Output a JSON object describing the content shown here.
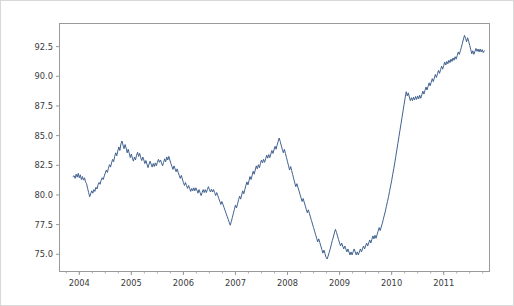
{
  "chart_data": {
    "type": "line",
    "title": "",
    "xlabel": "",
    "ylabel": "",
    "xlim": [
      2003.62,
      2011.88
    ],
    "ylim": [
      73.55,
      94.45
    ],
    "grid": false,
    "legend": null,
    "line_color": "#41618f",
    "background_color": "#ffffff",
    "axis_color": "#9a9a9a",
    "xticks": [
      2004,
      2005,
      2006,
      2007,
      2008,
      2009,
      2010,
      2011
    ],
    "xticklabels": [
      "2004",
      "2005",
      "2006",
      "2007",
      "2008",
      "2009",
      "2010",
      "2011"
    ],
    "yticks": [
      75.0,
      77.5,
      80.0,
      82.5,
      85.0,
      87.5,
      90.0,
      92.5
    ],
    "yticklabels": [
      "75.0",
      "77.5",
      "80.0",
      "82.5",
      "85.0",
      "87.5",
      "90.0",
      "92.5"
    ],
    "minor_xtick_interval": 0.25,
    "series": [
      {
        "name": "value",
        "x": [
          2003.88,
          2003.9,
          2003.92,
          2003.94,
          2003.96,
          2003.98,
          2004.0,
          2004.02,
          2004.04,
          2004.06,
          2004.08,
          2004.1,
          2004.12,
          2004.14,
          2004.16,
          2004.18,
          2004.2,
          2004.22,
          2004.24,
          2004.26,
          2004.28,
          2004.3,
          2004.32,
          2004.34,
          2004.36,
          2004.38,
          2004.4,
          2004.42,
          2004.44,
          2004.46,
          2004.48,
          2004.5,
          2004.52,
          2004.54,
          2004.56,
          2004.58,
          2004.6,
          2004.62,
          2004.64,
          2004.66,
          2004.68,
          2004.7,
          2004.72,
          2004.74,
          2004.76,
          2004.78,
          2004.8,
          2004.82,
          2004.84,
          2004.86,
          2004.88,
          2004.9,
          2004.92,
          2004.94,
          2004.96,
          2004.98,
          2005.0,
          2005.02,
          2005.04,
          2005.06,
          2005.08,
          2005.1,
          2005.12,
          2005.14,
          2005.16,
          2005.18,
          2005.2,
          2005.22,
          2005.24,
          2005.26,
          2005.28,
          2005.3,
          2005.32,
          2005.34,
          2005.36,
          2005.38,
          2005.4,
          2005.42,
          2005.44,
          2005.46,
          2005.48,
          2005.5,
          2005.52,
          2005.54,
          2005.56,
          2005.58,
          2005.6,
          2005.62,
          2005.64,
          2005.66,
          2005.68,
          2005.7,
          2005.72,
          2005.74,
          2005.76,
          2005.78,
          2005.8,
          2005.82,
          2005.84,
          2005.86,
          2005.88,
          2005.9,
          2005.92,
          2005.94,
          2005.96,
          2005.98,
          2006.0,
          2006.02,
          2006.04,
          2006.06,
          2006.08,
          2006.1,
          2006.12,
          2006.14,
          2006.16,
          2006.18,
          2006.2,
          2006.22,
          2006.24,
          2006.26,
          2006.28,
          2006.3,
          2006.32,
          2006.34,
          2006.36,
          2006.38,
          2006.4,
          2006.42,
          2006.44,
          2006.46,
          2006.48,
          2006.5,
          2006.52,
          2006.54,
          2006.56,
          2006.58,
          2006.6,
          2006.62,
          2006.64,
          2006.66,
          2006.68,
          2006.7,
          2006.72,
          2006.74,
          2006.76,
          2006.78,
          2006.8,
          2006.82,
          2006.84,
          2006.86,
          2006.88,
          2006.9,
          2006.92,
          2006.94,
          2006.96,
          2006.98,
          2007.0,
          2007.02,
          2007.04,
          2007.06,
          2007.08,
          2007.1,
          2007.12,
          2007.14,
          2007.16,
          2007.18,
          2007.2,
          2007.22,
          2007.24,
          2007.26,
          2007.28,
          2007.3,
          2007.32,
          2007.34,
          2007.36,
          2007.38,
          2007.4,
          2007.42,
          2007.44,
          2007.46,
          2007.48,
          2007.5,
          2007.52,
          2007.54,
          2007.56,
          2007.58,
          2007.6,
          2007.62,
          2007.64,
          2007.66,
          2007.68,
          2007.7,
          2007.72,
          2007.74,
          2007.76,
          2007.78,
          2007.8,
          2007.82,
          2007.84,
          2007.86,
          2007.88,
          2007.9,
          2007.92,
          2007.94,
          2007.96,
          2007.98,
          2008.0,
          2008.02,
          2008.04,
          2008.06,
          2008.08,
          2008.1,
          2008.12,
          2008.14,
          2008.16,
          2008.18,
          2008.2,
          2008.22,
          2008.24,
          2008.26,
          2008.28,
          2008.3,
          2008.32,
          2008.34,
          2008.36,
          2008.38,
          2008.4,
          2008.42,
          2008.44,
          2008.46,
          2008.48,
          2008.5,
          2008.52,
          2008.54,
          2008.56,
          2008.58,
          2008.6,
          2008.62,
          2008.64,
          2008.66,
          2008.68,
          2008.7,
          2008.72,
          2008.74,
          2008.76,
          2008.78,
          2008.8,
          2008.82,
          2008.84,
          2008.86,
          2008.88,
          2008.9,
          2008.92,
          2008.94,
          2008.96,
          2008.98,
          2009.0,
          2009.02,
          2009.04,
          2009.06,
          2009.08,
          2009.1,
          2009.12,
          2009.14,
          2009.16,
          2009.18,
          2009.2,
          2009.22,
          2009.24,
          2009.26,
          2009.28,
          2009.3,
          2009.32,
          2009.34,
          2009.36,
          2009.38,
          2009.4,
          2009.42,
          2009.44,
          2009.46,
          2009.48,
          2009.5,
          2009.52,
          2009.54,
          2009.56,
          2009.58,
          2009.6,
          2009.62,
          2009.64,
          2009.66,
          2009.68,
          2009.7,
          2009.72,
          2009.74,
          2009.76,
          2009.78,
          2009.8,
          2009.82,
          2009.84,
          2009.86,
          2009.88,
          2009.9,
          2009.92,
          2009.94,
          2009.96,
          2009.98,
          2010.0,
          2010.02,
          2010.04,
          2010.06,
          2010.08,
          2010.1,
          2010.12,
          2010.14,
          2010.16,
          2010.18,
          2010.2,
          2010.22,
          2010.24,
          2010.26,
          2010.28,
          2010.3,
          2010.32,
          2010.34,
          2010.36,
          2010.38,
          2010.4,
          2010.42,
          2010.44,
          2010.46,
          2010.48,
          2010.5,
          2010.52,
          2010.54,
          2010.56,
          2010.58,
          2010.6,
          2010.62,
          2010.64,
          2010.66,
          2010.68,
          2010.7,
          2010.72,
          2010.74,
          2010.76,
          2010.78,
          2010.8,
          2010.82,
          2010.84,
          2010.86,
          2010.88,
          2010.9,
          2010.92,
          2010.94,
          2010.96,
          2010.98,
          2011.0,
          2011.02,
          2011.04,
          2011.06,
          2011.08,
          2011.1,
          2011.12,
          2011.14,
          2011.16,
          2011.18,
          2011.2,
          2011.22,
          2011.24,
          2011.26,
          2011.28,
          2011.3,
          2011.32,
          2011.34,
          2011.36,
          2011.38,
          2011.4,
          2011.42,
          2011.44,
          2011.46,
          2011.48,
          2011.5,
          2011.52,
          2011.54,
          2011.56,
          2011.58,
          2011.6,
          2011.62,
          2011.64,
          2011.66,
          2011.68,
          2011.7,
          2011.72,
          2011.74,
          2011.76,
          2011.78
        ],
        "y": [
          81.55,
          81.62,
          81.4,
          81.75,
          81.5,
          81.82,
          81.45,
          81.7,
          81.3,
          81.55,
          81.25,
          81.45,
          81.1,
          80.95,
          80.55,
          80.2,
          79.85,
          80.1,
          80.35,
          80.15,
          80.45,
          80.3,
          80.65,
          80.5,
          80.85,
          81.05,
          80.9,
          81.25,
          81.45,
          81.3,
          81.6,
          81.85,
          82.1,
          81.9,
          82.25,
          82.55,
          82.35,
          82.7,
          83.0,
          82.8,
          83.25,
          83.55,
          83.3,
          83.7,
          84.05,
          83.75,
          84.3,
          84.55,
          84.2,
          83.9,
          84.25,
          83.95,
          83.55,
          83.85,
          83.5,
          83.15,
          83.45,
          83.1,
          82.85,
          83.2,
          82.95,
          83.35,
          83.6,
          83.25,
          83.5,
          83.15,
          82.9,
          83.2,
          82.95,
          82.65,
          82.9,
          82.6,
          82.3,
          82.6,
          82.85,
          82.6,
          82.35,
          82.65,
          82.4,
          82.7,
          82.45,
          82.75,
          83.0,
          82.75,
          82.95,
          82.7,
          82.45,
          82.75,
          83.05,
          82.8,
          83.2,
          82.95,
          83.25,
          82.95,
          82.65,
          82.4,
          82.15,
          82.45,
          82.2,
          81.95,
          82.2,
          81.9,
          81.65,
          81.4,
          81.65,
          81.35,
          81.05,
          80.8,
          81.05,
          80.8,
          80.55,
          80.8,
          80.55,
          80.3,
          80.55,
          80.35,
          80.6,
          80.35,
          80.6,
          80.4,
          80.15,
          80.45,
          80.2,
          79.95,
          80.2,
          80.45,
          80.2,
          80.45,
          80.2,
          80.45,
          80.7,
          80.45,
          80.25,
          80.5,
          80.25,
          80.45,
          80.2,
          79.95,
          80.2,
          79.95,
          79.7,
          79.45,
          79.2,
          79.45,
          79.2,
          78.95,
          78.7,
          78.45,
          78.2,
          77.95,
          77.7,
          77.45,
          77.75,
          78.1,
          78.45,
          78.8,
          79.15,
          78.9,
          79.25,
          79.6,
          79.9,
          79.65,
          80.0,
          80.35,
          80.1,
          80.45,
          80.8,
          81.1,
          80.85,
          81.2,
          81.55,
          81.3,
          81.65,
          82.0,
          81.75,
          82.1,
          82.45,
          82.2,
          82.55,
          82.3,
          82.65,
          82.95,
          82.7,
          83.0,
          82.75,
          83.05,
          83.35,
          83.1,
          83.4,
          83.15,
          83.45,
          83.75,
          83.5,
          83.8,
          84.1,
          83.85,
          84.2,
          84.5,
          84.8,
          84.5,
          84.15,
          83.85,
          83.55,
          83.85,
          83.5,
          83.15,
          82.8,
          82.45,
          82.1,
          82.4,
          82.05,
          81.7,
          81.35,
          81.0,
          80.7,
          80.95,
          80.65,
          80.35,
          80.05,
          79.75,
          79.45,
          79.7,
          79.4,
          79.1,
          78.8,
          78.5,
          78.75,
          78.45,
          78.15,
          77.85,
          77.55,
          77.25,
          76.95,
          76.65,
          76.35,
          76.05,
          76.3,
          76.0,
          75.7,
          75.4,
          75.1,
          75.35,
          75.05,
          74.75,
          74.6,
          74.85,
          75.15,
          75.45,
          75.8,
          76.15,
          76.45,
          76.8,
          77.1,
          76.85,
          76.55,
          76.25,
          75.95,
          75.7,
          75.95,
          75.7,
          75.45,
          75.7,
          75.45,
          75.2,
          75.45,
          75.2,
          74.95,
          75.2,
          74.95,
          75.2,
          75.45,
          75.2,
          74.95,
          75.2,
          74.95,
          75.2,
          75.45,
          75.2,
          75.45,
          75.7,
          75.45,
          75.7,
          75.95,
          75.7,
          75.95,
          76.2,
          75.95,
          76.25,
          76.55,
          76.3,
          76.6,
          76.35,
          76.65,
          76.95,
          77.25,
          77.0,
          77.3,
          77.6,
          77.95,
          78.3,
          78.65,
          79.05,
          79.45,
          79.85,
          80.3,
          80.75,
          81.2,
          81.7,
          82.2,
          82.7,
          83.25,
          83.8,
          84.35,
          84.9,
          85.45,
          86.0,
          86.55,
          87.1,
          87.65,
          88.2,
          88.7,
          88.35,
          88.6,
          88.25,
          87.95,
          88.2,
          87.95,
          88.25,
          88.0,
          88.3,
          88.05,
          88.35,
          88.1,
          88.4,
          88.15,
          88.45,
          88.75,
          88.5,
          88.8,
          89.1,
          88.85,
          89.15,
          89.45,
          89.2,
          89.5,
          89.8,
          89.55,
          89.85,
          90.15,
          89.9,
          90.2,
          90.5,
          90.25,
          90.55,
          90.85,
          90.6,
          90.9,
          91.2,
          90.95,
          91.25,
          91.05,
          91.35,
          91.15,
          91.45,
          91.25,
          91.55,
          91.35,
          91.65,
          91.45,
          91.75,
          92.05,
          91.85,
          92.15,
          92.45,
          92.8,
          93.15,
          93.45,
          93.2,
          92.9,
          93.25,
          92.95,
          92.6,
          92.25,
          91.9,
          92.15,
          91.85,
          92.1,
          92.35,
          92.1,
          92.3,
          92.05,
          92.3,
          92.05,
          92.25,
          92.0,
          92.15
        ]
      }
    ]
  }
}
